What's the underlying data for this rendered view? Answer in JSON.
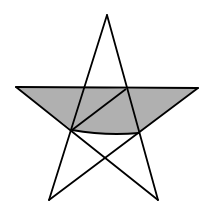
{
  "figure": {
    "width": 213,
    "height": 214,
    "colors": {
      "background": "#ffffff",
      "stroke": "#000000",
      "fill": "#b0b0b0"
    },
    "stroke_width": 1.8,
    "vertices": {
      "top": [
        107,
        15
      ],
      "left": [
        16,
        87
      ],
      "right": [
        198,
        88
      ],
      "bottom_left": [
        49,
        200
      ],
      "bottom_right": [
        158,
        200
      ]
    },
    "inner_points": {
      "upper_left": [
        86,
        87
      ],
      "upper_right": [
        126,
        89
      ],
      "lower_left": [
        72,
        130
      ],
      "lower_right": [
        139,
        133
      ],
      "bottom": [
        105,
        158
      ]
    },
    "shaded_region": {
      "points": "16,87 86,87 126,89 198,88 139,133 105,134 72,130",
      "diagonal": [
        [
          72,
          130
        ],
        [
          126,
          89
        ]
      ]
    },
    "lines": [
      {
        "name": "top-to-bottom-left",
        "from": [
          107,
          15
        ],
        "to": [
          49,
          200
        ]
      },
      {
        "name": "top-to-bottom-right",
        "from": [
          107,
          15
        ],
        "to": [
          158,
          200
        ]
      },
      {
        "name": "left-to-right",
        "from": [
          16,
          87
        ],
        "to": [
          198,
          88
        ]
      },
      {
        "name": "left-to-bottom-right",
        "from": [
          16,
          87
        ],
        "to": [
          158,
          200
        ]
      },
      {
        "name": "right-to-bottom-left",
        "from": [
          198,
          88
        ],
        "to": [
          49,
          200
        ]
      }
    ]
  }
}
